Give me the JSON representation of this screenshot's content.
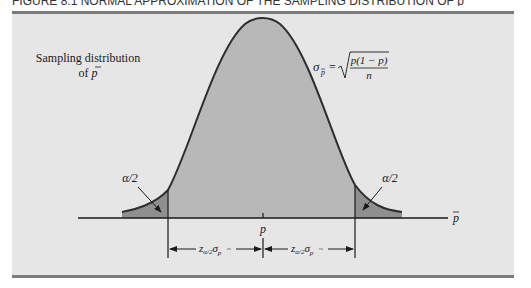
{
  "figure": {
    "caption_clipped": "FIGURE 8.1  NORMAL APPROXIMATION OF THE SAMPLING DISTRIBUTION OF p̄",
    "colors": {
      "panel_bg": "#e6e6e6",
      "rule": "#7b7b7b",
      "curve_fill_center": "#b8b8b8",
      "curve_fill_tail": "#8f8f8f",
      "curve_stroke": "#2e2e2e",
      "axis": "#1a1a1a"
    }
  },
  "labels": {
    "sampling_line1": "Sampling distribution",
    "sampling_line2_prefix": "of ",
    "sampling_line2_var": "p",
    "sigma_symbol": "σ",
    "sigma_sub": "p",
    "equals": "=",
    "formula_numerator": "p(1 − p)",
    "formula_denominator": "n",
    "alpha_left": "α/2",
    "alpha_right": "α/2",
    "axis_var": "p",
    "center_label": "p",
    "z_left": "z",
    "z_left_sub": "α/2",
    "z_left_sigma": "σ",
    "z_left_sigma_sub": "p",
    "z_right": "z",
    "z_right_sub": "α/2",
    "z_right_sigma": "σ",
    "z_right_sigma_sub": "p"
  }
}
